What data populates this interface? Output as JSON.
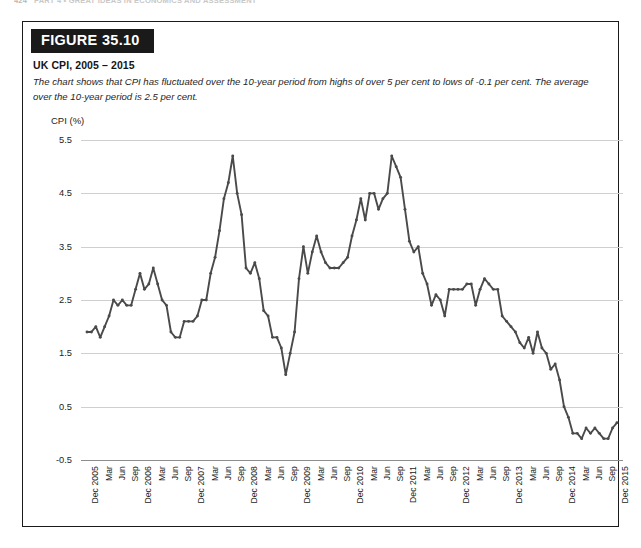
{
  "running_head": {
    "folio": "424",
    "text": "PART 4  •  GREAT IDEAS IN ECONOMICS AND ASSESSMENT"
  },
  "figure": {
    "tab_label": "FIGURE 35.10",
    "title": "UK CPI, 2005 – 2015",
    "caption": "The chart shows that CPI has fluctuated over the 10-year period from highs of over 5 per cent to lows of -0.1 per cent. The average over the 10-year period is 2.5 per cent."
  },
  "colors": {
    "line": "#4a4a4a",
    "grid": "#cfcfcf",
    "axis": "#8e8e8e",
    "tab_background": "#1a1a1a",
    "tab_text": "#ffffff",
    "border": "#1a1a1a"
  },
  "chart_data": {
    "type": "line",
    "title": "UK CPI, 2005 – 2015",
    "xlabel": "",
    "ylabel": "CPI (%)",
    "ylim": [
      -0.5,
      5.5
    ],
    "yticks": [
      -0.5,
      0.5,
      1.5,
      2.5,
      3.5,
      4.5,
      5.5
    ],
    "ytick_labels": [
      "-0.5",
      "0.5",
      "1.5",
      "2.5",
      "3.5",
      "4.5",
      "5.5"
    ],
    "grid": true,
    "legend": "none",
    "markers": true,
    "x_tick_labels": [
      "Dec 2005",
      "Mar",
      "Jun",
      "Sep",
      "Dec 2006",
      "Mar",
      "Jun",
      "Sep",
      "Dec 2007",
      "Mar",
      "Jun",
      "Sep",
      "Dec 2008",
      "Mar",
      "Jun",
      "Sep",
      "Dec 2009",
      "Mar",
      "Jun",
      "Sep",
      "Dec 2010",
      "Mar",
      "Jun",
      "Sep",
      "Dec 2011",
      "Mar",
      "Jun",
      "Sep",
      "Dec 2012",
      "Mar",
      "Jun",
      "Sep",
      "Dec 2013",
      "Mar",
      "Jun",
      "Sep",
      "Dec 2014",
      "Mar",
      "Jun",
      "Sep",
      "Dec 2015"
    ],
    "x_tick_step_months": 3,
    "x_start": "Dec 2005",
    "x_end": "Dec 2015",
    "series": [
      {
        "name": "UK CPI",
        "x": [
          "Dec 2005",
          "Jan 2006",
          "Feb 2006",
          "Mar 2006",
          "Apr 2006",
          "May 2006",
          "Jun 2006",
          "Jul 2006",
          "Aug 2006",
          "Sep 2006",
          "Oct 2006",
          "Nov 2006",
          "Dec 2006",
          "Jan 2007",
          "Feb 2007",
          "Mar 2007",
          "Apr 2007",
          "May 2007",
          "Jun 2007",
          "Jul 2007",
          "Aug 2007",
          "Sep 2007",
          "Oct 2007",
          "Nov 2007",
          "Dec 2007",
          "Jan 2008",
          "Feb 2008",
          "Mar 2008",
          "Apr 2008",
          "May 2008",
          "Jun 2008",
          "Jul 2008",
          "Aug 2008",
          "Sep 2008",
          "Oct 2008",
          "Nov 2008",
          "Dec 2008",
          "Jan 2009",
          "Feb 2009",
          "Mar 2009",
          "Apr 2009",
          "May 2009",
          "Jun 2009",
          "Jul 2009",
          "Aug 2009",
          "Sep 2009",
          "Oct 2009",
          "Nov 2009",
          "Dec 2009",
          "Jan 2010",
          "Feb 2010",
          "Mar 2010",
          "Apr 2010",
          "May 2010",
          "Jun 2010",
          "Jul 2010",
          "Aug 2010",
          "Sep 2010",
          "Oct 2010",
          "Nov 2010",
          "Dec 2010",
          "Jan 2011",
          "Feb 2011",
          "Mar 2011",
          "Apr 2011",
          "May 2011",
          "Jun 2011",
          "Jul 2011",
          "Aug 2011",
          "Sep 2011",
          "Oct 2011",
          "Nov 2011",
          "Dec 2011",
          "Jan 2012",
          "Feb 2012",
          "Mar 2012",
          "Apr 2012",
          "May 2012",
          "Jun 2012",
          "Jul 2012",
          "Aug 2012",
          "Sep 2012",
          "Oct 2012",
          "Nov 2012",
          "Dec 2012",
          "Jan 2013",
          "Feb 2013",
          "Mar 2013",
          "Apr 2013",
          "May 2013",
          "Jun 2013",
          "Jul 2013",
          "Aug 2013",
          "Sep 2013",
          "Oct 2013",
          "Nov 2013",
          "Dec 2013",
          "Jan 2014",
          "Feb 2014",
          "Mar 2014",
          "Apr 2014",
          "May 2014",
          "Jun 2014",
          "Jul 2014",
          "Aug 2014",
          "Sep 2014",
          "Oct 2014",
          "Nov 2014",
          "Dec 2014",
          "Jan 2015",
          "Feb 2015",
          "Mar 2015",
          "Apr 2015",
          "May 2015",
          "Jun 2015",
          "Jul 2015",
          "Aug 2015",
          "Sep 2015",
          "Oct 2015",
          "Nov 2015",
          "Dec 2015"
        ],
        "values": [
          1.9,
          1.9,
          2.0,
          1.8,
          2.0,
          2.2,
          2.5,
          2.4,
          2.5,
          2.4,
          2.4,
          2.7,
          3.0,
          2.7,
          2.8,
          3.1,
          2.8,
          2.5,
          2.4,
          1.9,
          1.8,
          1.8,
          2.1,
          2.1,
          2.1,
          2.2,
          2.5,
          2.5,
          3.0,
          3.3,
          3.8,
          4.4,
          4.7,
          5.2,
          4.5,
          4.1,
          3.1,
          3.0,
          3.2,
          2.9,
          2.3,
          2.2,
          1.8,
          1.8,
          1.6,
          1.1,
          1.5,
          1.9,
          2.9,
          3.5,
          3.0,
          3.4,
          3.7,
          3.4,
          3.2,
          3.1,
          3.1,
          3.1,
          3.2,
          3.3,
          3.7,
          4.0,
          4.4,
          4.0,
          4.5,
          4.5,
          4.2,
          4.4,
          4.5,
          5.2,
          5.0,
          4.8,
          4.2,
          3.6,
          3.4,
          3.5,
          3.0,
          2.8,
          2.4,
          2.6,
          2.5,
          2.2,
          2.7,
          2.7,
          2.7,
          2.7,
          2.8,
          2.8,
          2.4,
          2.7,
          2.9,
          2.8,
          2.7,
          2.7,
          2.2,
          2.1,
          2.0,
          1.9,
          1.7,
          1.6,
          1.8,
          1.5,
          1.9,
          1.6,
          1.5,
          1.2,
          1.3,
          1.0,
          0.5,
          0.3,
          0.0,
          0.0,
          -0.1,
          0.1,
          0.0,
          0.1,
          0.0,
          -0.1,
          -0.1,
          0.1,
          0.2
        ]
      }
    ],
    "annotations": {
      "max_value": 5.2,
      "min_value": -0.1,
      "average": 2.5
    }
  }
}
